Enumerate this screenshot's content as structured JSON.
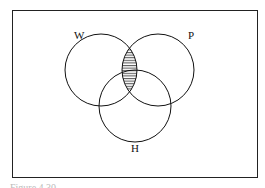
{
  "diagram": {
    "type": "venn",
    "sets": [
      {
        "id": "W",
        "label": "W"
      },
      {
        "id": "P",
        "label": "P"
      },
      {
        "id": "H",
        "label": "H"
      }
    ],
    "shaded_region": "W ∩ P",
    "shading": "horizontal-lines"
  },
  "caption": "Figure 4.30"
}
